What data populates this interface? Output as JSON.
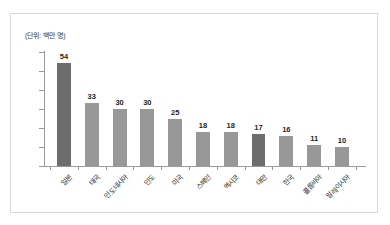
{
  "chart_data": {
    "type": "bar",
    "title": "",
    "subtitle": "",
    "unit_label": "(단위: 백만 명)",
    "xlabel": "",
    "ylabel": "",
    "ylim": [
      0,
      60
    ],
    "yticks": [
      0,
      10,
      20,
      30,
      40,
      50,
      60
    ],
    "ytick_labels": [
      "0",
      "10",
      "20",
      "30",
      "40",
      "50",
      "60"
    ],
    "grid": false,
    "legend": null,
    "categories": [
      "일본",
      "태국",
      "인도네시아",
      "인도",
      "미국",
      "스페인",
      "멕시코",
      "대만",
      "한국",
      "콜롬비아",
      "말레이시아"
    ],
    "values": [
      54,
      33,
      30,
      30,
      25,
      18,
      18,
      17,
      16,
      11,
      10
    ],
    "bars": [
      {
        "label": "일본",
        "value": 54,
        "value_text": "54",
        "highlight": true
      },
      {
        "label": "태국",
        "value": 33,
        "value_text": "33",
        "highlight": false
      },
      {
        "label": "인도네시아",
        "value": 30,
        "value_text": "30",
        "highlight": false
      },
      {
        "label": "인도",
        "value": 30,
        "value_text": "30",
        "highlight": false
      },
      {
        "label": "미국",
        "value": 25,
        "value_text": "25",
        "highlight": false
      },
      {
        "label": "스페인",
        "value": 18,
        "value_text": "18",
        "highlight": false
      },
      {
        "label": "멕시코",
        "value": 18,
        "value_text": "18",
        "highlight": false
      },
      {
        "label": "대만",
        "value": 17,
        "value_text": "17",
        "highlight": true
      },
      {
        "label": "한국",
        "value": 16,
        "value_text": "16",
        "highlight": false
      },
      {
        "label": "콜롬비아",
        "value": 11,
        "value_text": "11",
        "highlight": false
      },
      {
        "label": "말레이시아",
        "value": 10,
        "value_text": "10",
        "highlight": false
      }
    ],
    "colors": {
      "bar": "#989898",
      "bar_highlight": "#6d6d6d",
      "axis": "#9a9a9a",
      "text": "#2e2e2e",
      "frame": "#d9d9d9",
      "background": "#ffffff"
    }
  }
}
